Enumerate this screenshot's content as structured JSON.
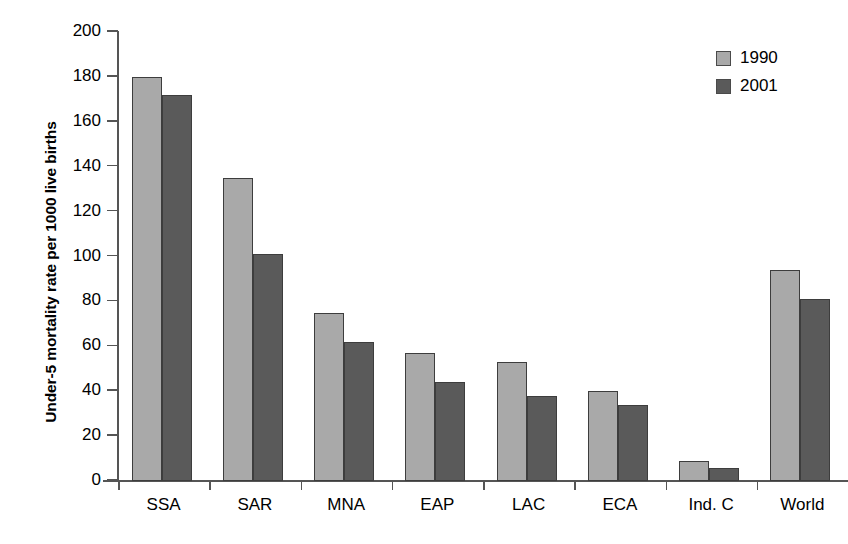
{
  "chart_data": {
    "type": "bar",
    "title": "",
    "xlabel": "",
    "ylabel": "Under-5 mortality rate per 1000 live births",
    "ylim": [
      0,
      200
    ],
    "ytick_step": 20,
    "yticks": [
      0,
      20,
      40,
      60,
      80,
      100,
      120,
      140,
      160,
      180,
      200
    ],
    "ytick_labels": [
      "0",
      "20",
      "40",
      "60",
      "80",
      "100",
      "120",
      "140",
      "160",
      "180",
      "200"
    ],
    "grid": false,
    "legend_position": "top-right",
    "categories": [
      "SSA",
      "SAR",
      "MNA",
      "EAP",
      "LAC",
      "ECA",
      "Ind. C",
      "World"
    ],
    "series": [
      {
        "name": "1990",
        "color": "#a9a9a9",
        "values": [
          180,
          135,
          75,
          57,
          53,
          40,
          9,
          94
        ]
      },
      {
        "name": "2001",
        "color": "#5a5a5a",
        "values": [
          172,
          101,
          62,
          44,
          38,
          34,
          6,
          81
        ]
      }
    ]
  },
  "legend": {
    "entries": [
      {
        "label": "1990",
        "swatch": "light-gray-swatch"
      },
      {
        "label": "2001",
        "swatch": "dark-gray-swatch"
      }
    ]
  }
}
